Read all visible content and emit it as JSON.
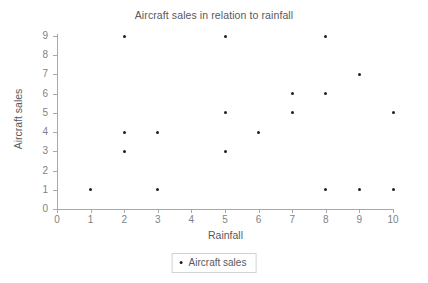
{
  "chart_data": {
    "type": "scatter",
    "title": "Aircraft sales in relation to rainfall",
    "xlabel": "Rainfall",
    "ylabel": "Aircraft sales",
    "xlim": [
      0,
      10
    ],
    "ylim": [
      0,
      9
    ],
    "xticks": [
      0,
      1,
      2,
      3,
      4,
      5,
      6,
      7,
      8,
      9,
      10
    ],
    "yticks": [
      0,
      1,
      2,
      3,
      4,
      5,
      6,
      7,
      8,
      9
    ],
    "grid": false,
    "legend_position": "bottom-center",
    "series": [
      {
        "name": "Aircraft sales",
        "marker": "dot",
        "color": "#231f20",
        "points": [
          {
            "x": 1,
            "y": 1
          },
          {
            "x": 2,
            "y": 9
          },
          {
            "x": 2,
            "y": 4
          },
          {
            "x": 2,
            "y": 3
          },
          {
            "x": 3,
            "y": 4
          },
          {
            "x": 3,
            "y": 1
          },
          {
            "x": 5,
            "y": 9
          },
          {
            "x": 5,
            "y": 5
          },
          {
            "x": 5,
            "y": 3
          },
          {
            "x": 6,
            "y": 4
          },
          {
            "x": 7,
            "y": 6
          },
          {
            "x": 7,
            "y": 5
          },
          {
            "x": 8,
            "y": 9
          },
          {
            "x": 8,
            "y": 6
          },
          {
            "x": 8,
            "y": 1
          },
          {
            "x": 9,
            "y": 7
          },
          {
            "x": 9,
            "y": 1
          },
          {
            "x": 10,
            "y": 5
          },
          {
            "x": 10,
            "y": 1
          }
        ]
      }
    ]
  },
  "legend": {
    "entries": [
      {
        "label": "Aircraft sales"
      }
    ]
  },
  "colors": {
    "axis": "#a7a9ac",
    "tick_label": "#808285",
    "title": "#58595b",
    "marker": "#231f20",
    "legend_border": "#d1d3d4",
    "background": "#ffffff"
  }
}
